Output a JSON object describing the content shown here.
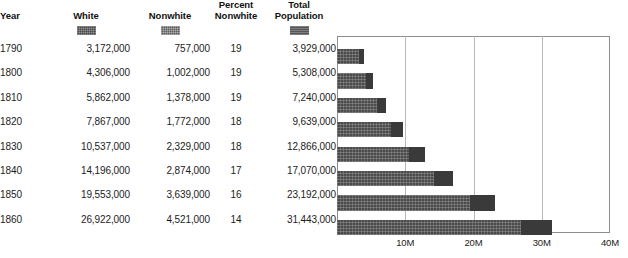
{
  "table": {
    "columns": [
      {
        "key": "year",
        "label": "Year",
        "swatch": null
      },
      {
        "key": "white",
        "label": "White",
        "swatch": "white-series-swatch"
      },
      {
        "key": "nonwhite",
        "label": "Nonwhite",
        "swatch": "nonwhite-series-swatch"
      },
      {
        "key": "percent_nonwhite",
        "label": "Percent\nNonwhite",
        "label_line1": "Percent",
        "label_line2": "Nonwhite",
        "swatch": null
      },
      {
        "key": "total",
        "label": "Total\nPopulation",
        "label_line1": "Total",
        "label_line2": "Population",
        "swatch": "total-series-swatch"
      }
    ],
    "rows": [
      {
        "year": "1790",
        "white": "3,172,000",
        "nonwhite": "757,000",
        "percent_nonwhite": "19",
        "total": "3,929,000"
      },
      {
        "year": "1800",
        "white": "4,306,000",
        "nonwhite": "1,002,000",
        "percent_nonwhite": "19",
        "total": "5,308,000"
      },
      {
        "year": "1810",
        "white": "5,862,000",
        "nonwhite": "1,378,000",
        "percent_nonwhite": "19",
        "total": "7,240,000"
      },
      {
        "year": "1820",
        "white": "7,867,000",
        "nonwhite": "1,772,000",
        "percent_nonwhite": "18",
        "total": "9,639,000"
      },
      {
        "year": "1830",
        "white": "10,537,000",
        "nonwhite": "2,329,000",
        "percent_nonwhite": "18",
        "total": "12,866,000"
      },
      {
        "year": "1840",
        "white": "14,196,000",
        "nonwhite": "2,874,000",
        "percent_nonwhite": "17",
        "total": "17,070,000"
      },
      {
        "year": "1850",
        "white": "19,553,000",
        "nonwhite": "3,639,000",
        "percent_nonwhite": "16",
        "total": "23,192,000"
      },
      {
        "year": "1860",
        "white": "26,922,000",
        "nonwhite": "4,521,000",
        "percent_nonwhite": "14",
        "total": "31,443,000"
      }
    ]
  },
  "colors": {
    "white_series": "#4b4b4b",
    "nonwhite_series": "#3a3a3a",
    "total_series": "#555555",
    "gridline": "#b9b9b9",
    "frame": "#8d8d8d",
    "background": "#ffffff",
    "text": "#1c1c1c"
  },
  "chart_data": {
    "type": "bar",
    "orientation": "horizontal",
    "stacked": true,
    "title": "",
    "xlabel": "",
    "ylabel": "",
    "categories": [
      "1790",
      "1800",
      "1810",
      "1820",
      "1830",
      "1840",
      "1850",
      "1860"
    ],
    "series": [
      {
        "name": "White",
        "values": [
          3172000,
          4306000,
          5862000,
          7867000,
          10537000,
          14196000,
          19553000,
          26922000
        ]
      },
      {
        "name": "Nonwhite",
        "values": [
          757000,
          1002000,
          1378000,
          1772000,
          2329000,
          2874000,
          3639000,
          4521000
        ]
      }
    ],
    "totals": [
      3929000,
      5308000,
      7240000,
      9639000,
      12866000,
      17070000,
      23192000,
      31443000
    ],
    "percent_nonwhite": [
      19,
      19,
      19,
      18,
      18,
      17,
      16,
      14
    ],
    "xlim": [
      0,
      40000000
    ],
    "xticks": [
      10000000,
      20000000,
      30000000,
      40000000
    ],
    "xticklabels": [
      "10M",
      "20M",
      "30M",
      "40M"
    ],
    "grid": true,
    "grid_axis": "x",
    "legend": "column-header-swatches"
  }
}
